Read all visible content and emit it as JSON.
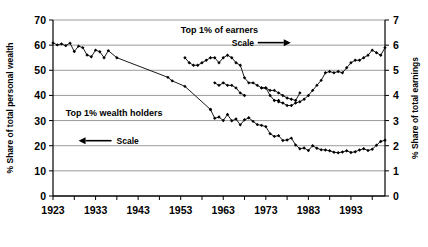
{
  "chart_data": {
    "type": "line",
    "title": "",
    "xlabel": "",
    "ylabel": "% Share of total personal wealth",
    "y2label": "% Share of total earnings",
    "xlim": [
      1923,
      2001
    ],
    "ylim": [
      0,
      70
    ],
    "y2lim": [
      0,
      7
    ],
    "yticks": [
      0,
      10,
      20,
      30,
      40,
      50,
      60,
      70
    ],
    "y2ticks": [
      0,
      1,
      2,
      3,
      4,
      5,
      6,
      7
    ],
    "xticks": [
      1923,
      1933,
      1943,
      1953,
      1963,
      1973,
      1983,
      1993
    ],
    "grid": true,
    "legend_position": "inline-annotations",
    "annotations": [
      {
        "name": "earnings-series-label",
        "text": "Top 1% of earners",
        "x": 1953,
        "y": 66
      },
      {
        "name": "earnings-scale-arrow",
        "text": "Scale",
        "arrow": "⟶",
        "x": 1965,
        "y": 61
      },
      {
        "name": "wealth-series-label",
        "text": "Top 1% wealth holders",
        "x": 1926,
        "y": 33
      },
      {
        "name": "wealth-scale-arrow",
        "text": "Scale",
        "arrow": "⟵",
        "x": 1929,
        "y": 22
      }
    ],
    "series": [
      {
        "name": "Top 1% wealth holders",
        "axis": "left",
        "marker": "diamond",
        "color": "#000000",
        "segments": [
          {
            "x": [
              1923,
              1924,
              1925,
              1926,
              1927,
              1928,
              1929,
              1930,
              1931,
              1932,
              1933,
              1934,
              1935,
              1936,
              1938,
              1950,
              1951,
              1954,
              1960
            ],
            "y": [
              60.9,
              60.1,
              60.5,
              59.8,
              60.8,
              57.5,
              59.6,
              59.0,
              56.1,
              55.4,
              58.0,
              57.4,
              55.0,
              57.8,
              55.0,
              47.2,
              45.8,
              43.6,
              34.4
            ]
          },
          {
            "x": [
              1960,
              1961,
              1962,
              1963,
              1964,
              1965,
              1966,
              1967,
              1968,
              1969,
              1970,
              1971,
              1972,
              1973,
              1974,
              1975,
              1976,
              1977,
              1978,
              1979,
              1980,
              1981,
              1982,
              1983,
              1984,
              1985,
              1986,
              1987,
              1988,
              1989,
              1990,
              1991,
              1992,
              1993,
              1994,
              1995,
              1996,
              1997,
              1998,
              1999,
              2000,
              2001
            ],
            "y": [
              34.4,
              30.9,
              31.4,
              30.0,
              32.4,
              29.9,
              30.6,
              28.3,
              30.3,
              31.1,
              29.7,
              28.4,
              28.1,
              27.6,
              24.8,
              23.7,
              24.0,
              22.1,
              22.3,
              23.0,
              20.3,
              18.8,
              19.1,
              18.1,
              20.0,
              19.0,
              18.4,
              18.3,
              18.0,
              17.4,
              17.2,
              17.5,
              18.0,
              17.3,
              17.6,
              18.3,
              18.8,
              18.1,
              18.6,
              20.2,
              21.7,
              22.2,
              22.4
            ]
          }
        ]
      },
      {
        "name": "Top 1% of earners",
        "axis": "right",
        "marker": "diamond",
        "color": "#000000",
        "segments": [
          {
            "x": [
              1954,
              1955,
              1956,
              1957,
              1958,
              1959,
              1960,
              1961,
              1962,
              1963,
              1964,
              1965,
              1966,
              1967,
              1968,
              1969,
              1970,
              1971,
              1972,
              1973,
              1974,
              1975,
              1976
            ],
            "y": [
              5.5,
              5.3,
              5.2,
              5.2,
              5.3,
              5.4,
              5.5,
              5.5,
              5.3,
              5.5,
              5.6,
              5.5,
              5.3,
              5.2,
              4.7,
              4.5,
              4.5,
              4.4,
              4.3,
              4.3,
              4.0,
              3.8,
              3.8
            ]
          },
          {
            "x": [
              1961,
              1962,
              1963,
              1964,
              1965,
              1966,
              1967,
              1968
            ],
            "y": [
              4.5,
              4.4,
              4.5,
              4.4,
              4.4,
              4.3,
              4.1,
              4.0
            ]
          },
          {
            "x": [
              1972,
              1973,
              1974,
              1975,
              1976,
              1977,
              1978,
              1979,
              1980,
              1981
            ],
            "y": [
              4.3,
              4.3,
              4.2,
              4.2,
              4.1,
              4.0,
              3.9,
              3.85,
              3.8,
              4.1
            ]
          },
          {
            "x": [
              1976,
              1977,
              1978,
              1979,
              1980,
              1981,
              1982,
              1983,
              1984,
              1985,
              1986,
              1987,
              1988,
              1989,
              1990,
              1991,
              1992,
              1993,
              1994,
              1995,
              1996,
              1997,
              1998,
              1999,
              2000,
              2001
            ],
            "y": [
              3.75,
              3.7,
              3.6,
              3.6,
              3.7,
              3.75,
              3.85,
              4.0,
              4.2,
              4.4,
              4.6,
              4.9,
              4.95,
              4.9,
              4.95,
              4.9,
              5.1,
              5.3,
              5.4,
              5.4,
              5.5,
              5.6,
              5.8,
              5.7,
              5.6,
              5.9
            ]
          }
        ]
      }
    ]
  },
  "axes": {
    "left_title": "% Share of total personal wealth",
    "right_title": "% Share of total earnings",
    "y_tick_labels": [
      "70",
      "60",
      "50",
      "40",
      "30",
      "20",
      "10",
      "0"
    ],
    "y2_tick_labels": [
      "7",
      "6",
      "5",
      "4",
      "3",
      "2",
      "1",
      "0"
    ],
    "x_tick_labels": [
      "1923",
      "1933",
      "1943",
      "1953",
      "1963",
      "1973",
      "1983",
      "1993"
    ]
  },
  "labels": {
    "earners": "Top 1% of earners",
    "wealth_holders": "Top 1% wealth holders",
    "scale_right": "Scale",
    "scale_left": "Scale"
  },
  "colors": {
    "line": "#000000",
    "grid": "#808080",
    "axis": "#000000",
    "background": "#ffffff"
  }
}
